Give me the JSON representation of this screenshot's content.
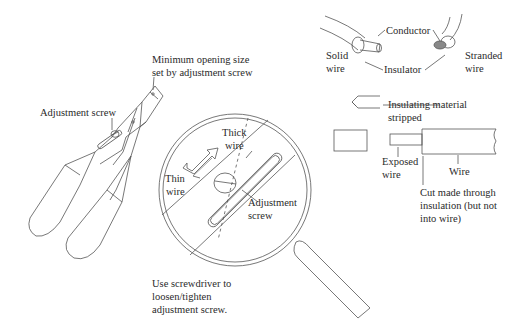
{
  "diagram": {
    "colors": {
      "line": "#555555",
      "text": "#2a2a2a",
      "background": "#ffffff",
      "strand_fill": "#888888"
    },
    "stripper_tool": {
      "labels": {
        "min_opening_line1": "Minimum opening size",
        "min_opening_line2": "set by adjustment screw",
        "adjustment_screw": "Adjustment screw"
      }
    },
    "magnifier": {
      "labels": {
        "thick_line1": "Thick",
        "thick_line2": "wire",
        "thin_line1": "Thin",
        "thin_line2": "wire",
        "screw_line1": "Adjustment",
        "screw_line2": "screw"
      },
      "caption": {
        "line1": "Use screwdriver to",
        "line2": "loosen/tighten",
        "line3": "adjustment screw."
      }
    },
    "wire_types": {
      "labels": {
        "conductor": "Conductor",
        "insulator": "Insulator",
        "solid_line1": "Solid",
        "solid_line2": "wire",
        "stranded_line1": "Stranded",
        "stranded_line2": "wire"
      }
    },
    "stripped_wire": {
      "labels": {
        "insulating_line1": "Insulating material",
        "insulating_line2": "stripped",
        "exposed_line1": "Exposed",
        "exposed_line2": "wire",
        "wire": "Wire",
        "cut_line1": "Cut made through",
        "cut_line2": "insulation (but not",
        "cut_line3": "into wire)"
      }
    }
  }
}
